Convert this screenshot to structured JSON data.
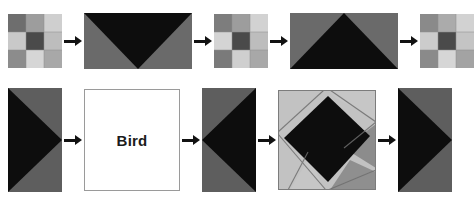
{
  "figure": {
    "background": "#ffffff",
    "palette": {
      "black": "#0d0d0d",
      "dark_gray": "#4a4a4a",
      "mid_gray": "#6e6e6e",
      "gray": "#8c8c8c",
      "light_gray": "#b0b0b0",
      "lighter_gray": "#c9c9c9",
      "pale_gray": "#dcdcdc",
      "white": "#ffffff",
      "border": "#9a9a9a",
      "arrow": "#121212"
    },
    "arrow_icon_name": "right-arrow-icon",
    "arrow_label": "transforms to"
  },
  "rows": [
    {
      "name": "top-row",
      "panels": [
        {
          "id": "top-panel-1",
          "name": "nine-patch-grid-a",
          "kind": "grid3x3",
          "shape": "square",
          "cells": [
            [
              "#6e6e6e",
              "#9d9d9d",
              "#cfcfcf"
            ],
            [
              "#c9c9c9",
              "#4a4a4a",
              "#bdbdbd"
            ],
            [
              "#8c8c8c",
              "#d6d6d6",
              "#a8a8a8"
            ]
          ]
        },
        {
          "id": "top-panel-2",
          "name": "down-triangle-panel",
          "kind": "triangle",
          "shape": "wide-rectangle",
          "direction": "down",
          "figure_color": "#0d0d0d",
          "background_color": "#6a6a6a"
        },
        {
          "id": "top-panel-3",
          "name": "nine-patch-grid-b",
          "kind": "grid3x3",
          "shape": "square",
          "cells": [
            [
              "#7d7d7d",
              "#9d9d9d",
              "#d2d2d2"
            ],
            [
              "#d4d4d4",
              "#4a4a4a",
              "#bdbdbd"
            ],
            [
              "#7a7a7a",
              "#cfcfcf",
              "#a8a8a8"
            ]
          ]
        },
        {
          "id": "top-panel-4",
          "name": "up-triangle-panel",
          "kind": "triangle",
          "shape": "wide-rectangle",
          "direction": "up",
          "figure_color": "#0d0d0d",
          "background_color": "#6a6a6a"
        },
        {
          "id": "top-panel-5",
          "name": "nine-patch-grid-c",
          "kind": "grid3x3",
          "shape": "square",
          "cells": [
            [
              "#8a8a8a",
              "#ababab",
              "#d2d2d2"
            ],
            [
              "#cccccc",
              "#4a4a4a",
              "#c4c4c4"
            ],
            [
              "#8a8a8a",
              "#d6d6d6",
              "#a3a3a3"
            ]
          ]
        }
      ],
      "arrows": 4
    },
    {
      "name": "bottom-row",
      "panels": [
        {
          "id": "bottom-panel-1",
          "name": "right-arrowhead-panel-a",
          "kind": "arrowhead",
          "shape": "tall-rectangle",
          "direction": "right",
          "figure_color": "#0d0d0d",
          "background_color": "#5e5e5e"
        },
        {
          "id": "bottom-panel-2",
          "name": "bird-label-panel",
          "kind": "text",
          "shape": "square",
          "text": "Bird",
          "background_color": "#ffffff",
          "border_color": "#9a9a9a",
          "text_color": "#1b1b1b"
        },
        {
          "id": "bottom-panel-3",
          "name": "left-arrowhead-panel",
          "kind": "arrowhead",
          "shape": "tall-rectangle",
          "direction": "left",
          "figure_color": "#0d0d0d",
          "background_color": "#5e5e5e"
        },
        {
          "id": "bottom-panel-4",
          "name": "pinwheel-diamond-panel",
          "kind": "pinwheel",
          "shape": "square",
          "center_color": "#0d0d0d",
          "light_color": "#c2c2c2",
          "mid_color": "#8c8c8c",
          "border_color": "#6e6e6e"
        },
        {
          "id": "bottom-panel-5",
          "name": "right-arrowhead-panel-b",
          "kind": "arrowhead",
          "shape": "tall-rectangle",
          "direction": "right",
          "figure_color": "#0d0d0d",
          "background_color": "#5e5e5e"
        }
      ],
      "arrows": 4
    }
  ]
}
